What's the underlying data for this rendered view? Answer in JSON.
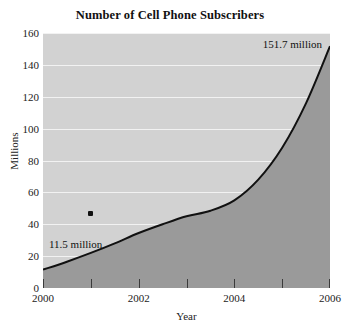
{
  "chart_data": {
    "type": "area",
    "title": "Number of Cell Phone Subscribers",
    "xlabel": "Year",
    "ylabel": "Millions",
    "xlim": [
      2000,
      2006
    ],
    "ylim": [
      0,
      160
    ],
    "grid": true,
    "legend": "none",
    "x": [
      2000,
      2000.5,
      2001,
      2001.5,
      2002,
      2002.5,
      2003,
      2003.5,
      2004,
      2004.5,
      2005,
      2005.5,
      2006
    ],
    "values": [
      11.5,
      16.5,
      22.0,
      28.0,
      34.5,
      40.0,
      45.0,
      48.5,
      55.0,
      68.0,
      88.0,
      116.0,
      151.7
    ],
    "series": [
      {
        "name": "Cell phone subscribers",
        "values": [
          11.5,
          16.5,
          22.0,
          28.0,
          34.5,
          40.0,
          45.0,
          48.5,
          55.0,
          68.0,
          88.0,
          116.0,
          151.7
        ]
      }
    ],
    "y_ticks": [
      0,
      20,
      40,
      60,
      80,
      100,
      120,
      140,
      160
    ],
    "y_tick_labels": [
      "0",
      "20",
      "40",
      "60",
      "80",
      "100",
      "120",
      "140",
      "160"
    ],
    "x_ticks": [
      2000,
      2001,
      2002,
      2003,
      2004,
      2005,
      2006
    ],
    "x_tick_labels": [
      "2000",
      "",
      "2002",
      "",
      "2004",
      "",
      "2006"
    ],
    "x_major_labels": [
      {
        "value": 2000,
        "label": "2000"
      },
      {
        "value": 2002,
        "label": "2002"
      },
      {
        "value": 2004,
        "label": "2004"
      },
      {
        "value": 2006,
        "label": "2006"
      }
    ],
    "annotations": [
      {
        "name": "start-value",
        "text": "11.5 million",
        "x": 2000,
        "y": 11.5
      },
      {
        "name": "end-value",
        "text": "151.7 million",
        "x": 2006,
        "y": 151.7
      }
    ],
    "markers": [
      {
        "name": "data-point-marker",
        "x": 2001,
        "y": 47
      }
    ],
    "colors": {
      "page_background": "#ffffff",
      "plot_background": "#d2d2d2",
      "area_fill": "#9a9a9a",
      "curve_line": "#111111",
      "gridline": "#f2f2f2",
      "text": "#1a1a1a"
    }
  }
}
